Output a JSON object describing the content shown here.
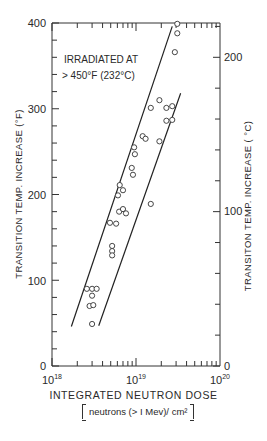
{
  "chart_data": {
    "type": "scatter",
    "title": "",
    "annotation": [
      "IRRADIATED AT",
      "> 450°F (232°C)"
    ],
    "xlabel": "INTEGRATED NEUTRON DOSE",
    "xlabel_units": "neutrons (> 1 Mev)/cm²",
    "x_scale": "log",
    "xlim": [
      1e+18,
      1e+20
    ],
    "x_ticks": [
      "10^18",
      "10^19",
      "10^20"
    ],
    "ylabel": "TRANSITION TEMP. INCREASE (°F)",
    "ylim": [
      0,
      400
    ],
    "y_ticks": [
      0,
      100,
      200,
      300,
      400
    ],
    "ylabel_right": "TRANSITON TEMP. INCREASE (°C)",
    "ylim_right": [
      0,
      222
    ],
    "y_ticks_right": [
      0,
      100,
      200
    ],
    "grid": false,
    "legend": null,
    "series": [
      {
        "name": "Measured data",
        "marker": "open-circle",
        "points": [
          {
            "x": 3.1e+19,
            "y": 399
          },
          {
            "x": 3.1e+19,
            "y": 388
          },
          {
            "x": 2.9e+19,
            "y": 366
          },
          {
            "x": 1.9e+19,
            "y": 310
          },
          {
            "x": 1.5e+19,
            "y": 301
          },
          {
            "x": 2.3e+19,
            "y": 301
          },
          {
            "x": 2.7e+19,
            "y": 303
          },
          {
            "x": 2.3e+19,
            "y": 286
          },
          {
            "x": 2.7e+19,
            "y": 287
          },
          {
            "x": 1.2e+19,
            "y": 268
          },
          {
            "x": 1.3e+19,
            "y": 265
          },
          {
            "x": 1.9e+19,
            "y": 262
          },
          {
            "x": 9.5e+18,
            "y": 255
          },
          {
            "x": 9.7e+18,
            "y": 247
          },
          {
            "x": 8.9e+18,
            "y": 231
          },
          {
            "x": 9.2e+18,
            "y": 223
          },
          {
            "x": 1.5e+19,
            "y": 189
          },
          {
            "x": 6.4e+18,
            "y": 211
          },
          {
            "x": 7e+18,
            "y": 205
          },
          {
            "x": 6.1e+18,
            "y": 199
          },
          {
            "x": 6.3e+18,
            "y": 180
          },
          {
            "x": 7e+18,
            "y": 183
          },
          {
            "x": 7.6e+18,
            "y": 178
          },
          {
            "x": 4.9e+18,
            "y": 167
          },
          {
            "x": 5.8e+18,
            "y": 166
          },
          {
            "x": 5.2e+18,
            "y": 140
          },
          {
            "x": 5.2e+18,
            "y": 134
          },
          {
            "x": 5.2e+18,
            "y": 129
          },
          {
            "x": 2.6e+18,
            "y": 90
          },
          {
            "x": 3e+18,
            "y": 90
          },
          {
            "x": 3.4e+18,
            "y": 90
          },
          {
            "x": 3e+18,
            "y": 82
          },
          {
            "x": 2.8e+18,
            "y": 70
          },
          {
            "x": 3.1e+18,
            "y": 71
          },
          {
            "x": 3e+18,
            "y": 49
          }
        ]
      },
      {
        "name": "Upper bound line",
        "type": "line",
        "points": [
          {
            "x": 1.7e+18,
            "y": 46
          },
          {
            "x": 2.7e+19,
            "y": 396
          }
        ]
      },
      {
        "name": "Lower bound line",
        "type": "line",
        "points": [
          {
            "x": 3.6e+18,
            "y": 47
          },
          {
            "x": 3.4e+19,
            "y": 318
          }
        ]
      }
    ]
  },
  "labels": {
    "annotation_line1": "IRRADIATED AT",
    "annotation_line2": "> 450°F (232°C)",
    "y_left_title": "TRANSITION  TEMP.  INCREASE  (°F)",
    "y_right_title": "TRANSITON  TEMP.  INCREASE  ( °C)",
    "x_title": "INTEGRATED  NEUTRON  DOSE",
    "x_units": "neutrons (> I Mev)/ cm²",
    "y_left_ticks": [
      "400",
      "300",
      "200",
      "100",
      "0"
    ],
    "y_right_ticks": [
      "200",
      "100",
      "0"
    ],
    "x_ticks": [
      {
        "base": "10",
        "exp": "18"
      },
      {
        "base": "10",
        "exp": "19"
      },
      {
        "base": "10",
        "exp": "20"
      }
    ]
  }
}
